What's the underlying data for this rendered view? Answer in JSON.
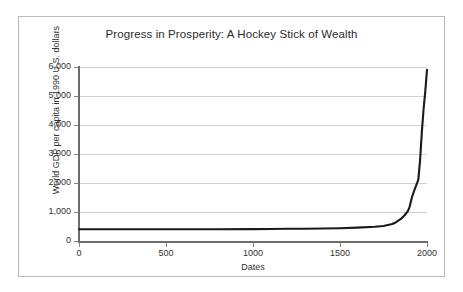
{
  "chart_data": {
    "type": "line",
    "title": "Progress in Prosperity: A Hockey Stick of Wealth",
    "xlabel": "Dates",
    "ylabel": "World GDP per capita in 1990 U.S. dollars",
    "xlim": [
      0,
      2000
    ],
    "ylim": [
      0,
      6000
    ],
    "grid": true,
    "legend": "none",
    "line_color": "#1a1a1a",
    "grid_color": "#d2d2d2",
    "axis_color": "#6d6d6d",
    "xticks": [
      0,
      500,
      1000,
      1500,
      2000
    ],
    "xtick_labels": [
      "0",
      "500",
      "1000",
      "1500",
      "2000"
    ],
    "yticks": [
      0,
      1000,
      2000,
      3000,
      4000,
      5000,
      6000
    ],
    "ytick_labels": [
      "0",
      "1,000",
      "2,000",
      "3,000",
      "4,000",
      "5,000",
      "6,000"
    ],
    "series": [
      {
        "name": "World GDP per capita",
        "x": [
          0,
          200,
          400,
          600,
          800,
          1000,
          1100,
          1200,
          1300,
          1400,
          1500,
          1600,
          1700,
          1750,
          1800,
          1820,
          1850,
          1870,
          1890,
          1900,
          1913,
          1930,
          1950,
          1960,
          1970,
          1980,
          1990,
          2000
        ],
        "values": [
          405,
          405,
          405,
          405,
          405,
          410,
          415,
          420,
          425,
          430,
          440,
          460,
          490,
          520,
          585,
          640,
          760,
          880,
          1030,
          1180,
          1500,
          1800,
          2110,
          2760,
          3730,
          4520,
          5150,
          5900
        ]
      }
    ]
  }
}
